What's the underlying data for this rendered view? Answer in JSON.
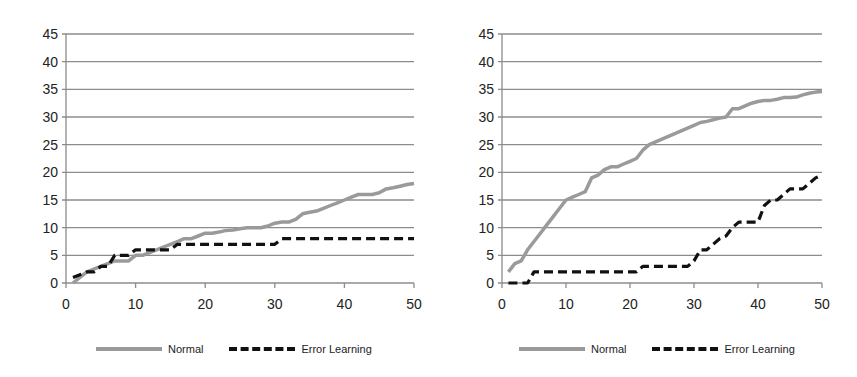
{
  "chart_data": [
    {
      "type": "line",
      "title": "",
      "xlabel": "",
      "ylabel": "",
      "xlim": [
        0,
        50
      ],
      "ylim": [
        0,
        45
      ],
      "xticks": [
        0,
        10,
        20,
        30,
        40,
        50
      ],
      "yticks": [
        0,
        5,
        10,
        15,
        20,
        25,
        30,
        35,
        40,
        45
      ],
      "grid": "horizontal",
      "legend_position": "bottom",
      "x": [
        1,
        2,
        3,
        4,
        5,
        6,
        7,
        8,
        9,
        10,
        11,
        12,
        13,
        14,
        15,
        16,
        17,
        18,
        19,
        20,
        21,
        22,
        23,
        24,
        25,
        26,
        27,
        28,
        29,
        30,
        31,
        32,
        33,
        34,
        35,
        36,
        37,
        38,
        39,
        40,
        41,
        42,
        43,
        44,
        45,
        46,
        47,
        48,
        49,
        50
      ],
      "series": [
        {
          "name": "Normal",
          "style": "solid",
          "color": "#9a9a9a",
          "values": [
            0,
            1,
            2,
            2.5,
            3,
            3.5,
            4,
            4,
            4,
            5,
            5,
            5.5,
            6,
            6.5,
            7,
            7.5,
            8,
            8,
            8.5,
            9,
            9,
            9.2,
            9.5,
            9.6,
            9.8,
            10,
            10,
            10,
            10.3,
            10.8,
            11,
            11,
            11.5,
            12.5,
            12.8,
            13,
            13.5,
            14,
            14.5,
            15,
            15.5,
            16,
            16,
            16,
            16.3,
            17,
            17.2,
            17.5,
            17.8,
            18
          ]
        },
        {
          "name": "Error Learning",
          "style": "dashed",
          "color": "#111111",
          "values": [
            1,
            1.5,
            2,
            2,
            3,
            3,
            5,
            5,
            5,
            6,
            6,
            6,
            6,
            6,
            6,
            7,
            7,
            7,
            7,
            7,
            7,
            7,
            7,
            7,
            7,
            7,
            7,
            7,
            7,
            7,
            8,
            8,
            8,
            8,
            8,
            8,
            8,
            8,
            8,
            8,
            8,
            8,
            8,
            8,
            8,
            8,
            8,
            8,
            8,
            8
          ]
        }
      ]
    },
    {
      "type": "line",
      "title": "",
      "xlabel": "",
      "ylabel": "",
      "xlim": [
        0,
        50
      ],
      "ylim": [
        0,
        45
      ],
      "xticks": [
        0,
        10,
        20,
        30,
        40,
        50
      ],
      "yticks": [
        0,
        5,
        10,
        15,
        20,
        25,
        30,
        35,
        40,
        45
      ],
      "grid": "horizontal",
      "legend_position": "bottom",
      "x": [
        1,
        2,
        3,
        4,
        5,
        6,
        7,
        8,
        9,
        10,
        11,
        12,
        13,
        14,
        15,
        16,
        17,
        18,
        19,
        20,
        21,
        22,
        23,
        24,
        25,
        26,
        27,
        28,
        29,
        30,
        31,
        32,
        33,
        34,
        35,
        36,
        37,
        38,
        39,
        40,
        41,
        42,
        43,
        44,
        45,
        46,
        47,
        48,
        49,
        50
      ],
      "series": [
        {
          "name": "Normal",
          "style": "solid",
          "color": "#9a9a9a",
          "values": [
            2,
            3.5,
            4,
            6,
            7.5,
            9,
            10.5,
            12,
            13.5,
            15,
            15.5,
            16,
            16.5,
            19,
            19.5,
            20.5,
            21,
            21,
            21.5,
            22,
            22.5,
            24,
            25,
            25.5,
            26,
            26.5,
            27,
            27.5,
            28,
            28.5,
            29,
            29.2,
            29.5,
            29.8,
            30,
            31.5,
            31.5,
            32,
            32.5,
            32.8,
            33,
            33,
            33.2,
            33.5,
            33.5,
            33.6,
            34,
            34.3,
            34.5,
            34.6
          ]
        },
        {
          "name": "Error Learning",
          "style": "dashed",
          "color": "#111111",
          "values": [
            0,
            0,
            0,
            0,
            2,
            2,
            2,
            2,
            2,
            2,
            2,
            2,
            2,
            2,
            2,
            2,
            2,
            2,
            2,
            2,
            2,
            3,
            3,
            3,
            3,
            3,
            3,
            3,
            3,
            4,
            6,
            6,
            7,
            8,
            8.5,
            10,
            11,
            11,
            11,
            11,
            14,
            15,
            15,
            16,
            17,
            17,
            17,
            18,
            19,
            19.5
          ]
        }
      ]
    }
  ],
  "legends": {
    "normal": "Normal",
    "error": "Error Learning"
  },
  "axis_labels": {
    "y": [
      "0",
      "5",
      "10",
      "15",
      "20",
      "25",
      "30",
      "35",
      "40",
      "45"
    ],
    "x": [
      "0",
      "10",
      "20",
      "30",
      "40",
      "50"
    ]
  }
}
